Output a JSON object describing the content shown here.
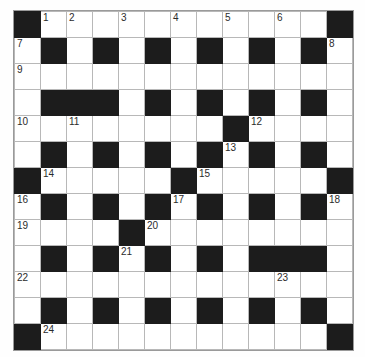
{
  "puzzle": {
    "title": "Crossword Grid",
    "rows": 13,
    "cols": 13,
    "cell_size_px": 25,
    "colors": {
      "background": "#ffffff",
      "block": "#1c1c1c",
      "gridline": "#b8b8b8",
      "border": "#9a9a9a",
      "number_text": "#2b2b2b"
    },
    "legend": {
      "0": "white (fillable cell)",
      "1": "black (blocked cell)"
    },
    "grid": [
      [
        1,
        0,
        0,
        0,
        0,
        0,
        0,
        0,
        0,
        0,
        0,
        0,
        1
      ],
      [
        0,
        1,
        0,
        1,
        0,
        1,
        0,
        1,
        0,
        1,
        0,
        1,
        0
      ],
      [
        0,
        0,
        0,
        0,
        0,
        0,
        0,
        0,
        0,
        0,
        0,
        0,
        0
      ],
      [
        0,
        1,
        1,
        1,
        0,
        1,
        0,
        1,
        0,
        1,
        0,
        1,
        0
      ],
      [
        0,
        0,
        0,
        0,
        0,
        0,
        0,
        0,
        1,
        0,
        0,
        0,
        0
      ],
      [
        0,
        1,
        0,
        1,
        0,
        1,
        0,
        1,
        0,
        1,
        0,
        1,
        0
      ],
      [
        1,
        0,
        0,
        0,
        0,
        0,
        1,
        0,
        0,
        0,
        0,
        0,
        1
      ],
      [
        0,
        1,
        0,
        1,
        0,
        1,
        0,
        1,
        0,
        1,
        0,
        1,
        0
      ],
      [
        0,
        0,
        0,
        0,
        1,
        0,
        0,
        0,
        0,
        0,
        0,
        0,
        0
      ],
      [
        0,
        1,
        0,
        1,
        0,
        1,
        0,
        1,
        0,
        1,
        1,
        1,
        0
      ],
      [
        0,
        0,
        0,
        0,
        0,
        0,
        0,
        0,
        0,
        0,
        0,
        0,
        0
      ],
      [
        0,
        1,
        0,
        1,
        0,
        1,
        0,
        1,
        0,
        1,
        0,
        1,
        0
      ],
      [
        1,
        0,
        0,
        0,
        0,
        0,
        0,
        0,
        0,
        0,
        0,
        0,
        1
      ]
    ],
    "numbers": [
      {
        "row": 0,
        "col": 1,
        "label": "1"
      },
      {
        "row": 0,
        "col": 2,
        "label": "2"
      },
      {
        "row": 0,
        "col": 4,
        "label": "3"
      },
      {
        "row": 0,
        "col": 6,
        "label": "4"
      },
      {
        "row": 0,
        "col": 8,
        "label": "5"
      },
      {
        "row": 0,
        "col": 10,
        "label": "6"
      },
      {
        "row": 1,
        "col": 0,
        "label": "7"
      },
      {
        "row": 1,
        "col": 12,
        "label": "8"
      },
      {
        "row": 2,
        "col": 0,
        "label": "9"
      },
      {
        "row": 4,
        "col": 0,
        "label": "10"
      },
      {
        "row": 4,
        "col": 2,
        "label": "11"
      },
      {
        "row": 4,
        "col": 9,
        "label": "12"
      },
      {
        "row": 5,
        "col": 8,
        "label": "13"
      },
      {
        "row": 6,
        "col": 1,
        "label": "14"
      },
      {
        "row": 6,
        "col": 7,
        "label": "15"
      },
      {
        "row": 7,
        "col": 0,
        "label": "16"
      },
      {
        "row": 7,
        "col": 6,
        "label": "17"
      },
      {
        "row": 7,
        "col": 12,
        "label": "18"
      },
      {
        "row": 8,
        "col": 0,
        "label": "19"
      },
      {
        "row": 8,
        "col": 5,
        "label": "20"
      },
      {
        "row": 9,
        "col": 4,
        "label": "21"
      },
      {
        "row": 10,
        "col": 0,
        "label": "22"
      },
      {
        "row": 10,
        "col": 10,
        "label": "23"
      },
      {
        "row": 12,
        "col": 1,
        "label": "24"
      }
    ]
  }
}
